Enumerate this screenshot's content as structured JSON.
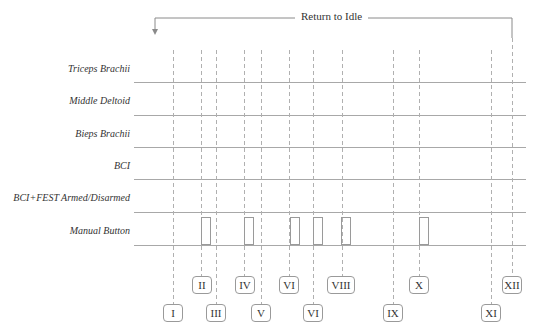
{
  "title": "Return to Idle",
  "rows": [
    {
      "label": "Triceps Brachii"
    },
    {
      "label": "Middle Deltoid"
    },
    {
      "label": "Bieps Brachii"
    },
    {
      "label": "BCI"
    },
    {
      "label": "BCI+FEST Armed/Disarmed"
    },
    {
      "label": "Manual Button"
    }
  ],
  "markers": [
    {
      "label": "I",
      "x": 173
    },
    {
      "label": "II",
      "x": 201
    },
    {
      "label": "III",
      "x": 216
    },
    {
      "label": "IV",
      "x": 244
    },
    {
      "label": "V",
      "x": 261
    },
    {
      "label": "VI",
      "x": 289
    },
    {
      "label": "VI",
      "x": 313
    },
    {
      "label": "VIII",
      "x": 342
    },
    {
      "label": "IX",
      "x": 393
    },
    {
      "label": "X",
      "x": 419
    },
    {
      "label": "XI",
      "x": 491
    },
    {
      "label": "XII",
      "x": 512
    }
  ],
  "colors": {
    "line": "#9a9a9a",
    "text": "#333333"
  }
}
